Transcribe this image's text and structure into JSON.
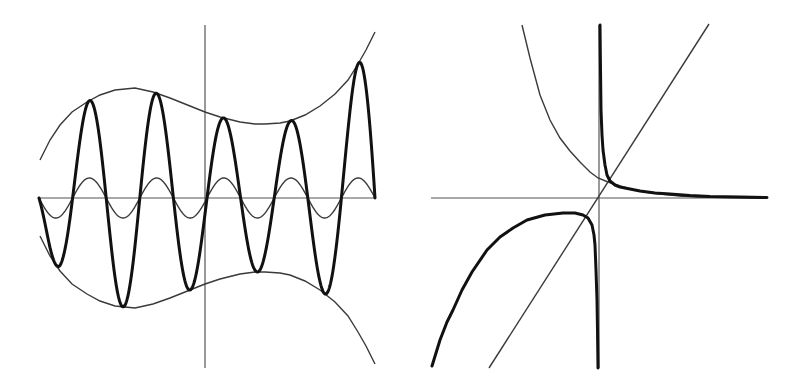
{
  "figure": {
    "title": "",
    "colors": {
      "axis": "#555555",
      "thin": "#3a3a3a",
      "thick": "#111111",
      "background": "#ffffff"
    }
  },
  "chart_data": [
    {
      "type": "line",
      "title": "",
      "xlabel": "",
      "ylabel": "",
      "grid": false,
      "legend": null,
      "description": "Left panel: amplitude-modulated sine wave (thick) bounded by a polynomial-like envelope and its mirror (thin), plus a small-amplitude unit sine (thin)",
      "pixel_frame": {
        "x_axis": {
          "y": 198,
          "x1": 39,
          "x2": 375
        },
        "y_axis": {
          "x": 205,
          "y1": 25,
          "y2": 368
        }
      },
      "sine": {
        "x_start": 39,
        "x_end": 375,
        "period_px": 67.2,
        "thin_amplitude_px": 20,
        "baseline_y": 198
      },
      "series": [
        {
          "name": "envelope_top",
          "style": "thin",
          "points": [
            [
              40,
              160
            ],
            [
              50,
              140
            ],
            [
              60,
              125
            ],
            [
              72,
              112
            ],
            [
              87,
              102
            ],
            [
              100,
              95
            ],
            [
              115,
              90
            ],
            [
              135,
              88
            ],
            [
              153,
              92
            ],
            [
              170,
              98
            ],
            [
              190,
              106
            ],
            [
              205,
              112
            ],
            [
              220,
              117
            ],
            [
              240,
              122
            ],
            [
              255,
              124
            ],
            [
              265,
              124
            ],
            [
              280,
              123
            ],
            [
              290,
              121
            ],
            [
              305,
              115
            ],
            [
              320,
              106
            ],
            [
              335,
              94
            ],
            [
              348,
              80
            ],
            [
              358,
              64
            ],
            [
              366,
              50
            ],
            [
              375,
              32
            ]
          ]
        },
        {
          "name": "envelope_bottom",
          "style": "thin",
          "mirror_of": "envelope_top",
          "mirror_axis_y": 198
        },
        {
          "name": "sine_small",
          "style": "thin",
          "generator": "baseline + amp*sin"
        },
        {
          "name": "modulated_sine",
          "style": "thick",
          "generator": "baseline + envelope*sin"
        }
      ]
    },
    {
      "type": "line",
      "title": "",
      "xlabel": "",
      "ylabel": "",
      "grid": false,
      "legend": null,
      "description": "Right panel: straight line through origin, decaying exponential-like curve (thin), and a curve with a vertical asymptote at x=0 (thick)",
      "pixel_frame": {
        "x_axis": {
          "y": 198,
          "x1": 431,
          "x2": 767
        },
        "y_axis": {
          "x": 599,
          "y1": 25,
          "y2": 368
        }
      },
      "series": [
        {
          "name": "diagonal_line",
          "style": "thin",
          "points": [
            [
              489,
              368
            ],
            [
              709,
              24
            ]
          ]
        },
        {
          "name": "decay_curve",
          "style": "thin",
          "points": [
            [
              522,
              25
            ],
            [
              530,
              58
            ],
            [
              540,
              95
            ],
            [
              550,
              120
            ],
            [
              560,
              138
            ],
            [
              570,
              151
            ],
            [
              580,
              162
            ],
            [
              590,
              172
            ],
            [
              598,
              178
            ],
            [
              608,
              182
            ],
            [
              620,
              186
            ],
            [
              630,
              189
            ],
            [
              645,
              192
            ],
            [
              660,
              194
            ],
            [
              680,
              196
            ],
            [
              700,
              197
            ],
            [
              730,
              197.5
            ],
            [
              767,
              198
            ]
          ]
        },
        {
          "name": "asymptote_curve_right",
          "style": "thick",
          "points": [
            [
              600,
              25
            ],
            [
              600.5,
              70
            ],
            [
              601,
              110
            ],
            [
              602,
              135
            ],
            [
              603,
              150
            ],
            [
              605,
              165
            ],
            [
              607,
              175
            ],
            [
              610,
              181
            ],
            [
              615,
              185
            ],
            [
              620,
              187
            ],
            [
              630,
              189
            ],
            [
              640,
              191
            ],
            [
              655,
              193
            ],
            [
              670,
              194
            ],
            [
              690,
              195.5
            ],
            [
              710,
              196.5
            ],
            [
              740,
              197
            ],
            [
              767,
              197.5
            ]
          ]
        },
        {
          "name": "asymptote_curve_left",
          "style": "thick",
          "points": [
            [
              432,
              366
            ],
            [
              440,
              340
            ],
            [
              447,
              322
            ],
            [
              453,
              310
            ],
            [
              462,
              290
            ],
            [
              472,
              272
            ],
            [
              487,
              250
            ],
            [
              500,
              237
            ],
            [
              513,
              228
            ],
            [
              527,
              220
            ],
            [
              545,
              215
            ],
            [
              563,
              213
            ],
            [
              575,
              213
            ],
            [
              583,
              215
            ],
            [
              588,
              218
            ],
            [
              592,
              225
            ],
            [
              594,
              235
            ],
            [
              595,
              245
            ],
            [
              596,
              270
            ],
            [
              597,
              300
            ],
            [
              597.5,
              330
            ],
            [
              598,
              368
            ]
          ]
        }
      ]
    }
  ]
}
